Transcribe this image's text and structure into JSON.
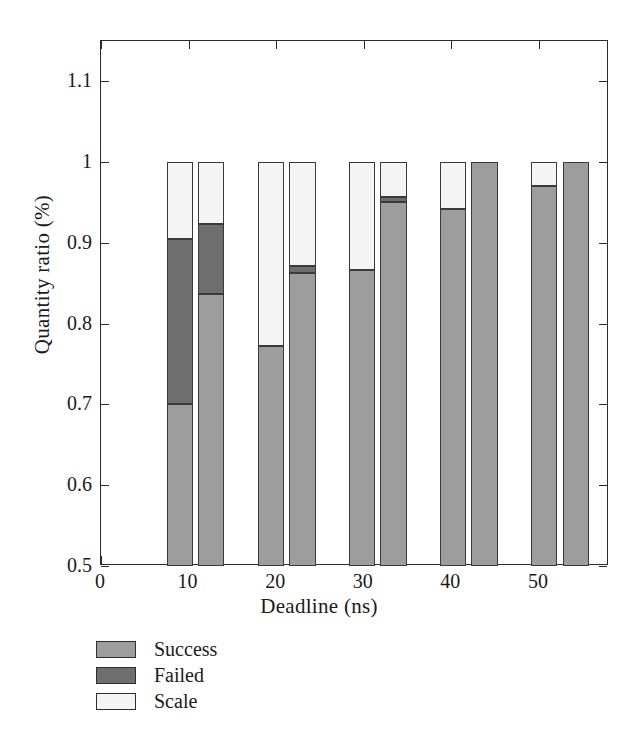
{
  "figure": {
    "background": "#ffffff"
  },
  "chart_data": {
    "type": "bar",
    "subtype": "grouped-stacked",
    "title": "",
    "xlabel": "Deadline (ns)",
    "ylabel": "Quantity ratio (%)",
    "xlim": [
      0,
      58
    ],
    "ylim": [
      0.5,
      1.15
    ],
    "xticks": [
      0,
      10,
      20,
      30,
      40,
      50
    ],
    "xtick_labels": [
      "0",
      "10",
      "20",
      "30",
      "40",
      "50"
    ],
    "yticks": [
      0.5,
      0.6,
      0.7,
      0.8,
      0.9,
      1,
      1.1
    ],
    "ytick_labels": [
      "0.5",
      "0.6",
      "0.7",
      "0.8",
      "0.9",
      "1",
      "1.1"
    ],
    "grid": false,
    "legend_position": "below-axes-left",
    "series": [
      {
        "name": "Success",
        "color": "#9d9d9d",
        "values": [
          0.7,
          0.837,
          0.772,
          0.863,
          0.866,
          0.951,
          0.942,
          1.0,
          0.971,
          1.0
        ]
      },
      {
        "name": "Failed",
        "color": "#6e6e6e",
        "values": [
          0.205,
          0.087,
          0.0,
          0.009,
          0.0,
          0.006,
          0.0,
          0.0,
          0.0,
          0.0
        ]
      },
      {
        "name": "Scale",
        "color": "#f2f2f2",
        "values": [
          0.095,
          0.076,
          0.228,
          0.128,
          0.134,
          0.043,
          0.058,
          0.0,
          0.029,
          0.0
        ]
      }
    ],
    "bars": [
      {
        "group": "10",
        "index": 0,
        "x_center": 9.0,
        "success_top": 0.7,
        "failed_top": 0.905,
        "scale_top": 1.0
      },
      {
        "group": "10",
        "index": 1,
        "x_center": 12.6,
        "success_top": 0.837,
        "failed_top": 0.924,
        "scale_top": 1.0
      },
      {
        "group": "20",
        "index": 0,
        "x_center": 19.4,
        "success_top": 0.772,
        "failed_top": 0.772,
        "scale_top": 1.0
      },
      {
        "group": "20",
        "index": 1,
        "x_center": 23.0,
        "success_top": 0.863,
        "failed_top": 0.872,
        "scale_top": 1.0
      },
      {
        "group": "30",
        "index": 0,
        "x_center": 29.8,
        "success_top": 0.866,
        "failed_top": 0.866,
        "scale_top": 1.0
      },
      {
        "group": "30",
        "index": 1,
        "x_center": 33.4,
        "success_top": 0.951,
        "failed_top": 0.957,
        "scale_top": 1.0
      },
      {
        "group": "40",
        "index": 0,
        "x_center": 40.2,
        "success_top": 0.942,
        "failed_top": 0.942,
        "scale_top": 1.0
      },
      {
        "group": "40",
        "index": 1,
        "x_center": 43.8,
        "success_top": 1.0,
        "failed_top": 1.0,
        "scale_top": 1.0
      },
      {
        "group": "50",
        "index": 0,
        "x_center": 50.6,
        "success_top": 0.971,
        "failed_top": 0.971,
        "scale_top": 1.0
      },
      {
        "group": "50",
        "index": 1,
        "x_center": 54.2,
        "success_top": 1.0,
        "failed_top": 1.0,
        "scale_top": 1.0
      }
    ],
    "legend": [
      {
        "label": "Success",
        "color": "#9d9d9d"
      },
      {
        "label": "Failed",
        "color": "#6e6e6e"
      },
      {
        "label": "Scale",
        "color": "#f4f4f4"
      }
    ]
  }
}
